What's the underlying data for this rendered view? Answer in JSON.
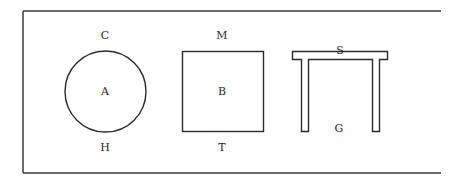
{
  "diagram": {
    "frame": {
      "color": "#3a3a3a",
      "open_side": "right"
    },
    "shapes": [
      {
        "id": "circle",
        "kind": "circle",
        "center_label": "A",
        "above_label": "C",
        "below_label": "H"
      },
      {
        "id": "square",
        "kind": "square",
        "center_label": "B",
        "above_label": "M",
        "below_label": "T"
      },
      {
        "id": "table",
        "kind": "table-shape",
        "top_label": "S",
        "bottom_label": "G"
      }
    ],
    "line_color": "#2b2b2b",
    "background": "#ffffff"
  }
}
